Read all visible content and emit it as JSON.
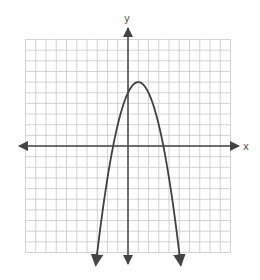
{
  "chart_data": {
    "type": "line",
    "title": "",
    "xlabel": "x",
    "ylabel": "y",
    "xlim": [
      -10,
      10
    ],
    "ylim": [
      -10,
      10
    ],
    "grid": true,
    "grid_step": 1,
    "legend": null,
    "series": [
      {
        "name": "parabola",
        "equation": "y = -(x - 1)^2 + 6",
        "vertex": [
          1,
          6
        ],
        "y_intercept": 5,
        "x_intercepts": [
          -1.45,
          3.45
        ],
        "opens": "down",
        "arrows_at_ends": true,
        "x": [
          -3.15,
          -3,
          -2,
          -1.45,
          -1,
          0,
          1,
          2,
          3,
          3.45,
          4,
          5,
          5.15
        ],
        "y": [
          -11.2,
          -10,
          -3,
          0,
          2,
          5,
          6,
          5,
          2,
          0,
          -3,
          -10,
          -11.2
        ]
      }
    ]
  },
  "axes": {
    "x_label": "x",
    "y_label": "y"
  },
  "colors": {
    "grid": "#c8c8c8",
    "axis": "#444444",
    "curve": "#404040",
    "background": "#ffffff"
  }
}
